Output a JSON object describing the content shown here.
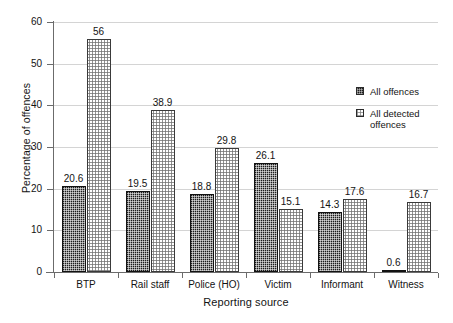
{
  "chart_data": {
    "type": "bar",
    "title": "",
    "subtitle": "",
    "xlabel": "Reporting source",
    "ylabel": "Percentage of offences",
    "categories": [
      "BTP",
      "Rail staff",
      "Police (HO)",
      "Victim",
      "Informant",
      "Witness"
    ],
    "series": [
      {
        "name": "All offences",
        "values": [
          20.6,
          19.5,
          18.8,
          26.1,
          14.3,
          0.6
        ],
        "labels": [
          "20.6",
          "19.5",
          "18.8",
          "26.1",
          "14.3",
          "0.6"
        ],
        "color": "#1c1c1c",
        "pattern": "dense-dark-checker"
      },
      {
        "name": "All detected offences",
        "values": [
          56,
          38.9,
          29.8,
          15.1,
          17.6,
          16.7
        ],
        "labels": [
          "56",
          "38.9",
          "29.8",
          "15.1",
          "17.6",
          "16.7"
        ],
        "color": "#ffffff",
        "pattern": "light-dot"
      }
    ],
    "ylim": [
      0,
      60
    ],
    "yticks": [
      0,
      10,
      20,
      30,
      40,
      50,
      60
    ],
    "ytick_labels": [
      "0",
      "10",
      "20",
      "30",
      "40",
      "50",
      "60"
    ],
    "grid": "horizontal",
    "grid_color": "#d4d4d4",
    "axis_color": "#6b6b6b",
    "legend_position": "right-inside",
    "legend": [
      "All offences",
      "All detected offences"
    ],
    "data_labels_shown": true
  }
}
